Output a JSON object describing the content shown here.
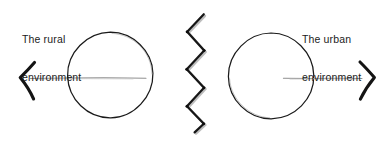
{
  "canvas": {
    "width": 390,
    "height": 145,
    "background": "#ffffff",
    "ink": "#141414",
    "ink_light": "#8a8a8a",
    "ink_shadow": "#b9b9b9"
  },
  "labels": {
    "left": {
      "name": "the-rural-environment",
      "line1": "The rural",
      "line2": "environment"
    },
    "right": {
      "name": "the-urban-environment",
      "line1": "The urban",
      "line2": "environment"
    }
  },
  "chart_data": {
    "type": "diagram",
    "title": "",
    "elements": [
      {
        "id": "rural-circle",
        "type": "circle",
        "cx": 110,
        "cy": 75,
        "r": 43,
        "style": "hand-drawn outline",
        "fill": "none",
        "stroke": "#141414"
      },
      {
        "id": "rural-axis",
        "type": "line",
        "x1": 30,
        "y1": 78,
        "x2": 146,
        "y2": 78,
        "stroke": "#8a8a8a",
        "arrow": "left"
      },
      {
        "id": "rural-arrowhead",
        "type": "chevron",
        "direction": "left",
        "x": 20,
        "y": 78,
        "stroke": "#141414"
      },
      {
        "id": "zigzag-divider",
        "type": "zigzag",
        "x_min": 186,
        "x_max": 206,
        "y_min": 14,
        "y_max": 132,
        "segments": 6,
        "stroke": "#141414"
      },
      {
        "id": "urban-circle",
        "type": "circle",
        "cx": 271,
        "cy": 76,
        "r": 43,
        "style": "hand-drawn outline",
        "fill": "none",
        "stroke": "#141414"
      },
      {
        "id": "urban-axis",
        "type": "line",
        "x1": 283,
        "y1": 78,
        "x2": 362,
        "y2": 78,
        "stroke": "#8a8a8a",
        "arrow": "right"
      },
      {
        "id": "urban-arrowhead",
        "type": "chevron",
        "direction": "right",
        "x": 372,
        "y": 78,
        "stroke": "#141414"
      }
    ],
    "annotations": [
      {
        "text": "The rural environment",
        "x": 22,
        "y": 14
      },
      {
        "text": "The urban environment",
        "x": 302,
        "y": 14
      }
    ]
  }
}
